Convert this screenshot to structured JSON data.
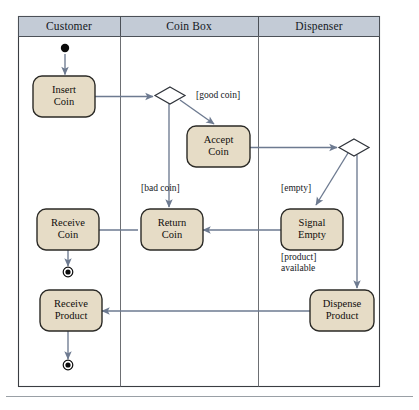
{
  "diagram": {
    "type": "uml-activity-diagram-with-swimlanes",
    "frame": {
      "x": 18,
      "y": 16,
      "width": 362,
      "height": 371
    },
    "colors": {
      "lane_header_fill": "#c3cbd6",
      "lane_header_stroke": "#4b5057",
      "frame_stroke": "#3a3d42",
      "lane_divider": "#6d6f73",
      "activity_fill": "#e6dcc6",
      "activity_stroke": "#2b2a26",
      "flow_stroke": "#6d7a90",
      "node_marker": "#0b0b0b",
      "page_rule": "#9aa0a6",
      "text": "#14181d"
    },
    "lanes": [
      {
        "id": "customer",
        "label": "Customer",
        "x": 18,
        "width": 102
      },
      {
        "id": "coin-box",
        "label": "Coin Box",
        "x": 120,
        "width": 138
      },
      {
        "id": "dispenser",
        "label": "Dispenser",
        "x": 258,
        "width": 122
      }
    ],
    "lane_header": {
      "y": 16,
      "height": 20
    },
    "nodes": [
      {
        "id": "start",
        "kind": "initial-node",
        "lane": "customer",
        "cx": 65,
        "cy": 50,
        "r": 4.2
      },
      {
        "id": "insert-coin",
        "kind": "activity",
        "lane": "customer",
        "label": "Insert Coin",
        "lines": [
          "Insert",
          "Coin"
        ],
        "x": 33,
        "y": 76,
        "w": 62,
        "h": 41
      },
      {
        "id": "decision-coin",
        "kind": "decision",
        "lane": "coin-box",
        "cx": 170,
        "cy": 95,
        "rx": 15,
        "ry": 8
      },
      {
        "id": "accept-coin",
        "kind": "activity",
        "lane": "coin-box",
        "label": "Accept Coin",
        "lines": [
          "Accept",
          "Coin"
        ],
        "x": 187,
        "y": 126,
        "w": 63,
        "h": 41
      },
      {
        "id": "decision-stock",
        "kind": "decision",
        "lane": "dispenser",
        "cx": 354,
        "cy": 147,
        "rx": 15,
        "ry": 8
      },
      {
        "id": "receive-coin",
        "kind": "activity",
        "lane": "customer",
        "label": "Receive Coin",
        "lines": [
          "Receive",
          "Coin"
        ],
        "x": 37,
        "y": 209,
        "w": 62,
        "h": 41
      },
      {
        "id": "return-coin",
        "kind": "activity",
        "lane": "coin-box",
        "label": "Return Coin",
        "lines": [
          "Return",
          "Coin"
        ],
        "x": 138,
        "y": 209,
        "w": 62,
        "h": 41
      },
      {
        "id": "signal-empty",
        "kind": "activity",
        "lane": "dispenser",
        "label": "Signal Empty",
        "lines": [
          "Signal",
          "Empty"
        ],
        "x": 281,
        "y": 209,
        "w": 62,
        "h": 41
      },
      {
        "id": "end-coin",
        "kind": "final-node",
        "lane": "customer",
        "cx": 68,
        "cy": 272,
        "r_outer": 4.6,
        "r_inner": 2.6
      },
      {
        "id": "receive-product",
        "kind": "activity",
        "lane": "customer",
        "label": "Receive Product",
        "lines": [
          "Receive",
          "Product"
        ],
        "x": 37,
        "y": 290,
        "w": 62,
        "h": 41
      },
      {
        "id": "dispense-product",
        "kind": "activity",
        "lane": "dispenser",
        "label": "Dispense Product",
        "lines": [
          "Dispense",
          "Product"
        ],
        "x": 310,
        "y": 290,
        "w": 64,
        "h": 41
      },
      {
        "id": "end-product",
        "kind": "final-node",
        "lane": "customer",
        "cx": 68,
        "cy": 365,
        "r_outer": 4.6,
        "r_inner": 2.6
      }
    ],
    "guards": [
      {
        "id": "good-coin",
        "text": "[good coin]",
        "x": 196,
        "y": 93
      },
      {
        "id": "bad-coin",
        "text": "[bad coin]",
        "x": 141,
        "y": 186
      },
      {
        "id": "empty",
        "text": "[empty]",
        "x": 281,
        "y": 186
      },
      {
        "id": "product-available",
        "text": "[product] available",
        "line1": "[product]",
        "line2": "available",
        "x": 281,
        "y": 255
      }
    ],
    "edges": [
      {
        "id": "start-to-insert",
        "from": "start",
        "to": "insert-coin"
      },
      {
        "id": "insert-to-decision",
        "from": "insert-coin",
        "to": "decision-coin"
      },
      {
        "id": "decision-to-accept",
        "from": "decision-coin",
        "to": "accept-coin",
        "guard": "[good coin]"
      },
      {
        "id": "decision-to-return",
        "from": "decision-coin",
        "to": "return-coin",
        "guard": "[bad coin]"
      },
      {
        "id": "accept-to-decision-stock",
        "from": "accept-coin",
        "to": "decision-stock"
      },
      {
        "id": "stock-to-signal",
        "from": "decision-stock",
        "to": "signal-empty",
        "guard": "[empty]"
      },
      {
        "id": "stock-to-dispense",
        "from": "decision-stock",
        "to": "dispense-product",
        "guard": "[product] available"
      },
      {
        "id": "signal-to-return",
        "from": "signal-empty",
        "to": "return-coin"
      },
      {
        "id": "return-to-receive-coin",
        "from": "return-coin",
        "to": "receive-coin"
      },
      {
        "id": "receive-coin-to-end",
        "from": "receive-coin",
        "to": "end-coin"
      },
      {
        "id": "dispense-to-receive-product",
        "from": "dispense-product",
        "to": "receive-product"
      },
      {
        "id": "receive-product-to-end",
        "from": "receive-product",
        "to": "end-product"
      }
    ]
  }
}
